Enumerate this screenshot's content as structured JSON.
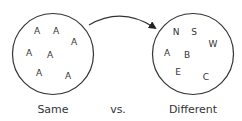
{
  "diagram": {
    "left_set": {
      "label": "Same",
      "center": [
        53,
        54
      ],
      "radius": 41,
      "letters": [
        {
          "text": "A",
          "x": 37,
          "y": 34
        },
        {
          "text": "A",
          "x": 56,
          "y": 34
        },
        {
          "text": "A",
          "x": 74,
          "y": 45
        },
        {
          "text": "A",
          "x": 29,
          "y": 56
        },
        {
          "text": "A",
          "x": 50,
          "y": 58
        },
        {
          "text": "A",
          "x": 39,
          "y": 76
        },
        {
          "text": "A",
          "x": 68,
          "y": 79
        }
      ]
    },
    "separator_label": "vs.",
    "right_set": {
      "label": "Different",
      "center": [
        193,
        54
      ],
      "radius": 41,
      "letters": [
        {
          "text": "N",
          "x": 176,
          "y": 35
        },
        {
          "text": "S",
          "x": 194,
          "y": 35
        },
        {
          "text": "W",
          "x": 213,
          "y": 47
        },
        {
          "text": "A",
          "x": 167,
          "y": 56
        },
        {
          "text": "B",
          "x": 187,
          "y": 58
        },
        {
          "text": "E",
          "x": 178,
          "y": 75
        },
        {
          "text": "C",
          "x": 206,
          "y": 80
        }
      ]
    },
    "arrow": {
      "from": "left_set",
      "to": "right_set",
      "direction": "left-to-right"
    },
    "colors": {
      "stroke": "#333333",
      "text": "#333333",
      "background": "#ffffff"
    }
  }
}
